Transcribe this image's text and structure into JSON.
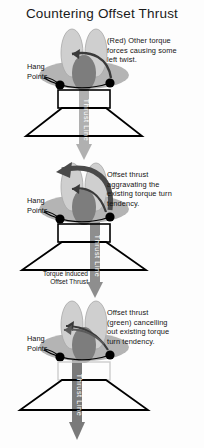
{
  "title": "Countering Offset Thrust",
  "colors": {
    "background": "#fdfdfd",
    "text": "#141414",
    "wing_body": "#b4b4b4",
    "pod_light": "#cfcfcf",
    "pod_outline": "#9a9a9a",
    "center_pod": "#7d7d7d",
    "hang_point": "#000000",
    "frame_stroke": "#000000",
    "thrust_line_light": "#b0b0b0",
    "thrust_line_mid": "#8e8e8e",
    "thrust_line_dark": "#7a7a7a",
    "torque_arrow": "#3a3a3a",
    "sweep_arrow": "#4a4a4a"
  },
  "labels": {
    "hang_points": "Hang\nPoints",
    "hang_points_line1": "Hang",
    "hang_points_line2": "Points",
    "thrust_line": "Thrust Line",
    "torque_induced_line1": "Torque induced",
    "torque_induced_line2": "Offset Thrust"
  },
  "panels": [
    {
      "id": "panel-one",
      "name": "baseline-torque",
      "callout": "(Red) Other torque forces causing some left twist.",
      "callout_lines": [
        "(Red) Other torque",
        "forces causing some",
        "left twist."
      ],
      "thrust_line_label": "Thrust Line",
      "thrust_offset": "center",
      "hang_points_label_line1": "Hang",
      "hang_points_label_line2": "Points"
    },
    {
      "id": "panel-two",
      "name": "offset-thrust-aggravating",
      "callout": "Offset thrust aggravating the existing torque turn tendency.",
      "callout_lines": [
        "Offset thrust",
        "aggravating the",
        "existing torque turn",
        "tendency."
      ],
      "thrust_line_label": "Thrust Line",
      "thrust_offset": "right",
      "hang_points_label_line1": "Hang",
      "hang_points_label_line2": "Points",
      "extra_caption_line1": "Torque induced",
      "extra_caption_line2": "Offset Thrust"
    },
    {
      "id": "panel-three",
      "name": "offset-thrust-cancelling",
      "callout": "Offset thrust (green) cancelling out existing torque turn tendency.",
      "callout_lines": [
        "Offset thrust",
        "(green) cancelling",
        "out existing torque",
        "turn tendency."
      ],
      "thrust_line_label": "Thrust Line",
      "thrust_offset": "left",
      "hang_points_label_line1": "Hang",
      "hang_points_label_line2": "Points"
    }
  ]
}
